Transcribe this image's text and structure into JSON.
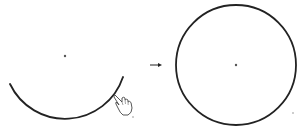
{
  "diagram": {
    "colors": {
      "stroke": "#222222",
      "background": "#ffffff",
      "dot": "#555555"
    },
    "left_panel": {
      "center": [
        65,
        56
      ],
      "arc_start": [
        10,
        84
      ],
      "arc_end": [
        123,
        77
      ],
      "radius": 61,
      "cursor": "hand-pointer-icon"
    },
    "arrow": {
      "from": [
        150,
        65
      ],
      "to": [
        162,
        65
      ],
      "icon": "right-arrow-icon"
    },
    "right_panel": {
      "center": [
        236,
        65
      ],
      "radius": 60
    }
  }
}
